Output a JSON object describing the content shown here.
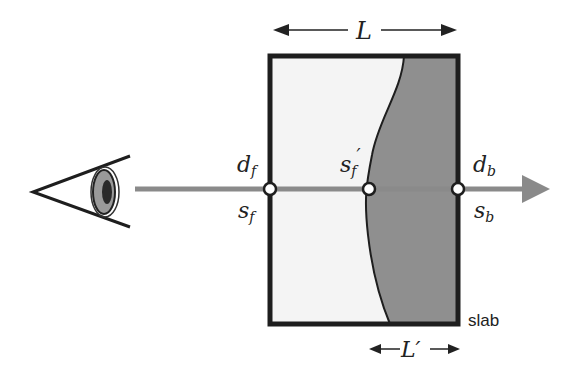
{
  "diagram": {
    "type": "slab-viewing-ray",
    "labels": {
      "L": "L",
      "L_prime": "L′",
      "slab": "slab",
      "d_f": "d",
      "d_f_sub": "f",
      "s_f": "s",
      "s_f_sub": "f",
      "s_f_prime": "s",
      "s_f_prime_sub": "f",
      "s_f_prime_mark": "′",
      "d_b": "d",
      "d_b_sub": "b",
      "s_b": "s",
      "s_b_sub": "b"
    },
    "colors": {
      "slab_light": "#f4f4f4",
      "slab_dark": "#8f8f8f",
      "outline": "#1e1e1e",
      "ray": "#8a8a8a",
      "iris": "#9a9a9a",
      "pupil": "#2a2a2a"
    },
    "icons": [
      "eye-icon",
      "arrow-right-icon"
    ]
  }
}
